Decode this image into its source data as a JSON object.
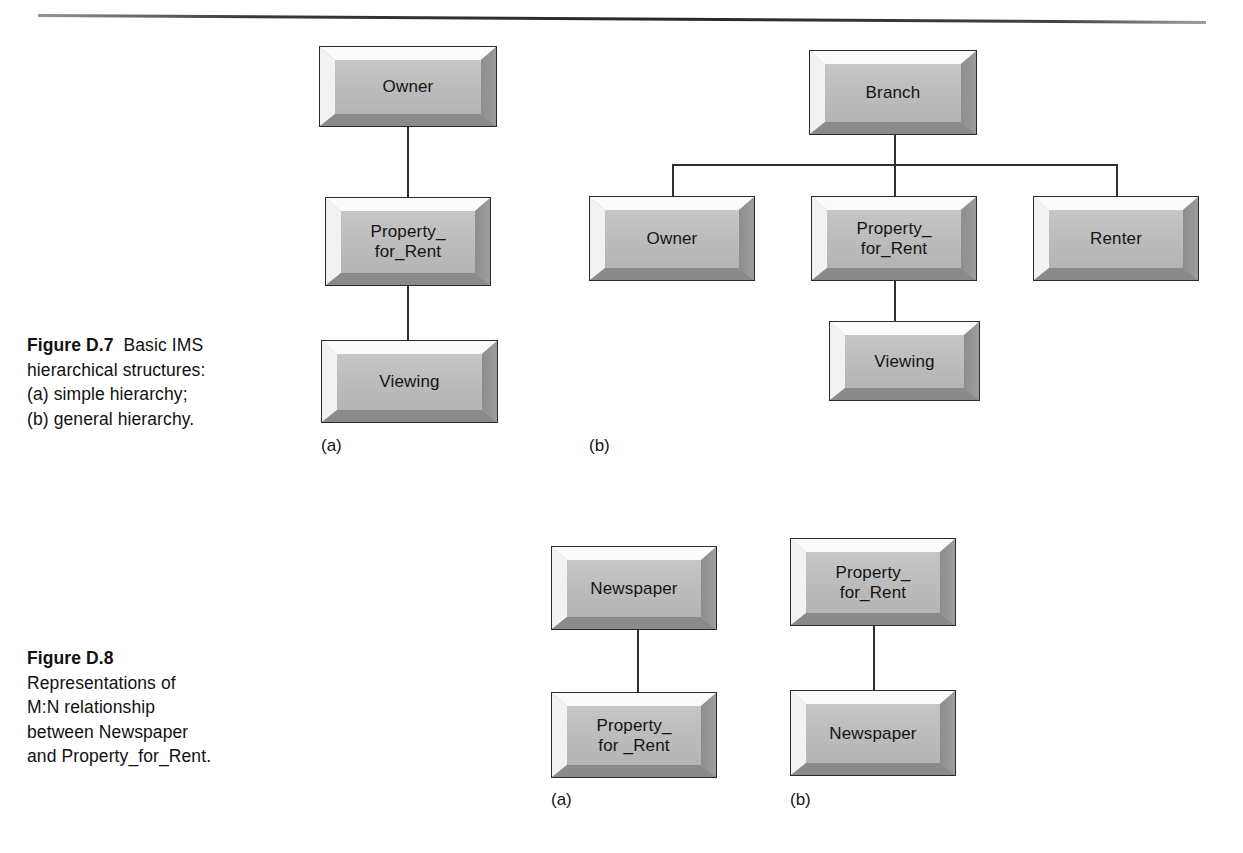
{
  "page": {
    "rule_present": true,
    "background_color": "#ffffff",
    "ink_color": "#141414"
  },
  "figures": [
    {
      "id": "figure-d7",
      "caption": {
        "number": "Figure D.7",
        "lines": [
          "Basic IMS",
          "hierarchical structures:",
          "(a) simple hierarchy;",
          "(b) general hierarchy."
        ]
      },
      "diagrams": [
        {
          "id": "d7-a",
          "sublabel": "(a)",
          "type": "simple-hierarchy",
          "nodes": [
            {
              "id": "d7a-owner",
              "label": "Owner"
            },
            {
              "id": "d7a-property",
              "label": "Property_\nfor_Rent"
            },
            {
              "id": "d7a-viewing",
              "label": "Viewing"
            }
          ],
          "edges": [
            {
              "from": "Owner",
              "to": "Property_for_Rent"
            },
            {
              "from": "Property_for_Rent",
              "to": "Viewing"
            }
          ]
        },
        {
          "id": "d7-b",
          "sublabel": "(b)",
          "type": "general-hierarchy",
          "nodes": [
            {
              "id": "d7b-branch",
              "label": "Branch"
            },
            {
              "id": "d7b-owner",
              "label": "Owner"
            },
            {
              "id": "d7b-property",
              "label": "Property_\nfor_Rent"
            },
            {
              "id": "d7b-renter",
              "label": "Renter"
            },
            {
              "id": "d7b-viewing",
              "label": "Viewing"
            }
          ],
          "edges": [
            {
              "from": "Branch",
              "to": "Owner"
            },
            {
              "from": "Branch",
              "to": "Property_for_Rent"
            },
            {
              "from": "Branch",
              "to": "Renter"
            },
            {
              "from": "Property_for_Rent",
              "to": "Viewing"
            }
          ]
        }
      ]
    },
    {
      "id": "figure-d8",
      "caption": {
        "number": "Figure D.8",
        "lines": [
          "Representations of",
          "M:N relationship",
          "between Newspaper",
          "and Property_for_Rent."
        ]
      },
      "diagrams": [
        {
          "id": "d8-a",
          "sublabel": "(a)",
          "type": "simple-hierarchy",
          "nodes": [
            {
              "id": "d8a-newspaper",
              "label": "Newspaper"
            },
            {
              "id": "d8a-property",
              "label": "Property_\nfor _Rent"
            }
          ],
          "edges": [
            {
              "from": "Newspaper",
              "to": "Property_for_Rent"
            }
          ]
        },
        {
          "id": "d8-b",
          "sublabel": "(b)",
          "type": "simple-hierarchy",
          "nodes": [
            {
              "id": "d8b-property",
              "label": "Property_\nfor_Rent"
            },
            {
              "id": "d8b-newspaper",
              "label": "Newspaper"
            }
          ],
          "edges": [
            {
              "from": "Property_for_Rent",
              "to": "Newspaper"
            }
          ]
        }
      ]
    }
  ]
}
